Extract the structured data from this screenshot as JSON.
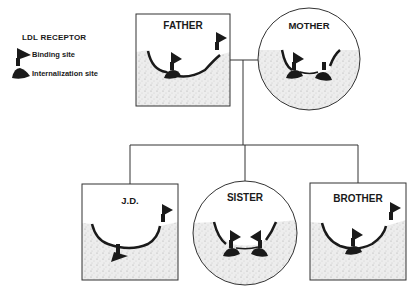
{
  "legend": {
    "title": "LDL RECEPTOR",
    "items": [
      {
        "label": "Binding site",
        "icon": "binding-site-icon"
      },
      {
        "label": "Internalization site",
        "icon": "internalization-site-icon"
      }
    ]
  },
  "pedigree": {
    "parents": [
      {
        "label": "FATHER",
        "shape": "square",
        "sex": "male"
      },
      {
        "label": "MOTHER",
        "shape": "circle",
        "sex": "female"
      }
    ],
    "children": [
      {
        "label": "J.D.",
        "shape": "square",
        "sex": "male"
      },
      {
        "label": "SISTER",
        "shape": "circle",
        "sex": "female"
      },
      {
        "label": "BROTHER",
        "shape": "square",
        "sex": "male"
      }
    ]
  },
  "colors": {
    "ink": "#1a1a1a",
    "stipple": "#e9e9e9",
    "background": "#ffffff"
  }
}
